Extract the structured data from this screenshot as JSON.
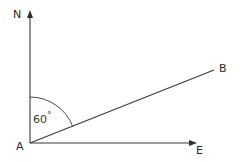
{
  "diagram": {
    "type": "bearing-angle-diagram",
    "background_color": "#ffffff",
    "stroke_color": "#3a3a3a",
    "text_color": "#2b2b2b",
    "labels": {
      "north": "N",
      "east": "E",
      "vertex": "A",
      "ray_end": "B",
      "angle_value": "60",
      "angle_unit": "°",
      "angle_full": "60°"
    },
    "geometry": {
      "vertex_point": {
        "x": 30,
        "y": 143
      },
      "north_ray_tip": {
        "x": 30,
        "y": 11
      },
      "east_ray_tip": {
        "x": 196,
        "y": 143
      },
      "b_ray_tip": {
        "x": 214,
        "y": 70
      },
      "arc_radius": 46,
      "arc_start": {
        "x": 30,
        "y": 97
      },
      "arc_end": {
        "x": 72,
        "y": 126
      }
    }
  }
}
